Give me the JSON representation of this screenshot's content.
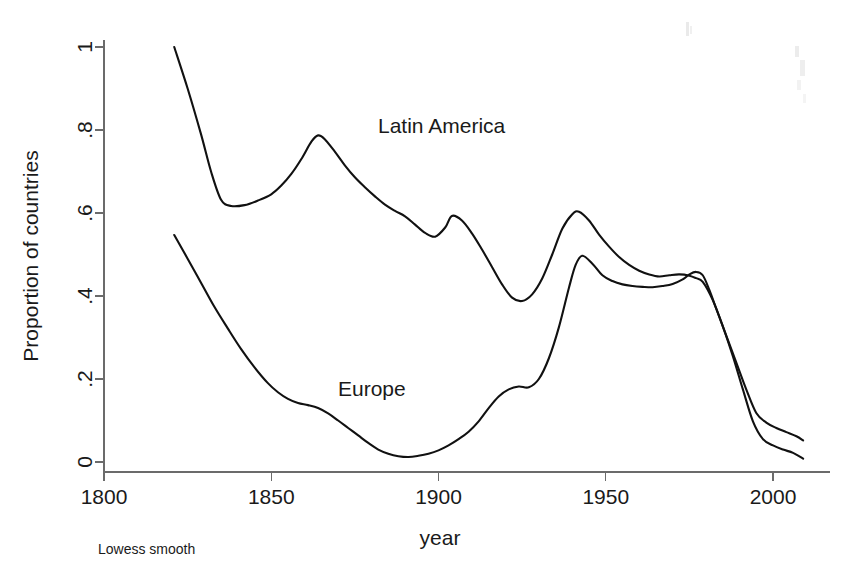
{
  "chart_data": {
    "type": "line",
    "title": "",
    "subtitle": "",
    "xlabel": "year",
    "ylabel": "Proportion of countries",
    "note": "Lowess smooth",
    "xlim": [
      1795,
      2012
    ],
    "ylim": [
      0,
      1
    ],
    "xticks": [
      1800,
      1850,
      1900,
      1950,
      2000
    ],
    "xticklabels": [
      "1800",
      "1850",
      "1900",
      "1950",
      "2000"
    ],
    "yticks": [
      0,
      0.2,
      0.4,
      0.6,
      0.8,
      1
    ],
    "yticklabels": [
      "0",
      ".2",
      ".4",
      ".6",
      ".8",
      "1"
    ],
    "grid": false,
    "legend": "inline-annotations",
    "series": [
      {
        "name": "Latin America",
        "label_position": {
          "x": 1882,
          "y": 0.845
        },
        "x": [
          1821,
          1825,
          1829,
          1832,
          1835,
          1838,
          1842,
          1846,
          1850,
          1853,
          1856,
          1859,
          1862,
          1864,
          1866,
          1869,
          1872,
          1875,
          1878,
          1881,
          1884,
          1887,
          1890,
          1893,
          1896,
          1899,
          1902,
          1904,
          1907,
          1910,
          1913,
          1916,
          1919,
          1922,
          1925,
          1928,
          1931,
          1934,
          1937,
          1940,
          1942,
          1945,
          1948,
          1951,
          1954,
          1957,
          1960,
          1963,
          1966,
          1969,
          1972,
          1975,
          1977,
          1979,
          1982,
          1985,
          1988,
          1991,
          1994,
          1997,
          2000,
          2003,
          2006,
          2009
        ],
        "y": [
          1.0,
          0.9,
          0.79,
          0.7,
          0.632,
          0.617,
          0.619,
          0.63,
          0.645,
          0.666,
          0.694,
          0.73,
          0.772,
          0.787,
          0.778,
          0.748,
          0.715,
          0.686,
          0.662,
          0.64,
          0.62,
          0.605,
          0.592,
          0.572,
          0.552,
          0.543,
          0.565,
          0.593,
          0.582,
          0.551,
          0.512,
          0.47,
          0.428,
          0.396,
          0.388,
          0.404,
          0.442,
          0.5,
          0.562,
          0.597,
          0.603,
          0.582,
          0.548,
          0.519,
          0.494,
          0.475,
          0.461,
          0.452,
          0.447,
          0.45,
          0.452,
          0.449,
          0.443,
          0.434,
          0.39,
          0.327,
          0.255,
          0.175,
          0.098,
          0.055,
          0.04,
          0.03,
          0.022,
          0.008
        ]
      },
      {
        "name": "Europe",
        "label_position": {
          "x": 1852,
          "y": 0.225
        },
        "x": [
          1821,
          1825,
          1829,
          1833,
          1837,
          1841,
          1845,
          1849,
          1852,
          1855,
          1858,
          1861,
          1864,
          1867,
          1870,
          1873,
          1876,
          1879,
          1882,
          1885,
          1888,
          1891,
          1894,
          1897,
          1900,
          1903,
          1906,
          1909,
          1912,
          1915,
          1918,
          1921,
          1924,
          1927,
          1930,
          1933,
          1936,
          1939,
          1941,
          1943,
          1946,
          1949,
          1952,
          1955,
          1958,
          1961,
          1964,
          1967,
          1970,
          1973,
          1975,
          1977,
          1979,
          1981,
          1983,
          1986,
          1989,
          1992,
          1995,
          1998,
          2001,
          2004,
          2007,
          2009
        ],
        "y": [
          0.547,
          0.49,
          0.432,
          0.374,
          0.322,
          0.272,
          0.228,
          0.19,
          0.168,
          0.152,
          0.142,
          0.137,
          0.13,
          0.117,
          0.1,
          0.082,
          0.064,
          0.046,
          0.03,
          0.02,
          0.014,
          0.012,
          0.015,
          0.02,
          0.028,
          0.04,
          0.055,
          0.073,
          0.098,
          0.13,
          0.158,
          0.175,
          0.182,
          0.18,
          0.2,
          0.25,
          0.325,
          0.42,
          0.475,
          0.497,
          0.478,
          0.45,
          0.436,
          0.428,
          0.424,
          0.422,
          0.421,
          0.424,
          0.429,
          0.44,
          0.452,
          0.458,
          0.45,
          0.414,
          0.37,
          0.305,
          0.24,
          0.175,
          0.118,
          0.095,
          0.082,
          0.072,
          0.062,
          0.052
        ]
      }
    ]
  },
  "axes": {
    "y_title": "Proportion of countries",
    "x_title": "year",
    "note": "Lowess smooth"
  },
  "annotations": {
    "latin_america": "Latin America",
    "europe": "Europe"
  },
  "colors": {
    "line": "#111111",
    "axis": "#6b6b6b",
    "text": "#1a1a1a",
    "background": "#ffffff"
  }
}
